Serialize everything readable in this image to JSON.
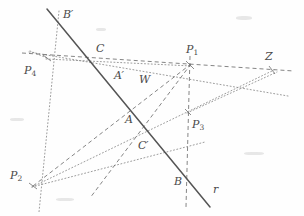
{
  "figure": {
    "type": "geometry-diagram",
    "width": 304,
    "height": 216,
    "background_color": "#fefefe",
    "ink_color": "#4a4a4a",
    "line_color_solid": "#555555",
    "line_color_dashed": "#777777",
    "line_color_dotted": "#8a8a8a"
  },
  "labels": [
    {
      "name": "label-B-prime",
      "base": "B",
      "prime": "′",
      "sub": "",
      "x": 63,
      "y": 9
    },
    {
      "name": "label-C",
      "base": "C",
      "prime": "",
      "sub": "",
      "x": 96,
      "y": 43
    },
    {
      "name": "label-P1",
      "base": "P",
      "prime": "",
      "sub": "1",
      "x": 186,
      "y": 44
    },
    {
      "name": "label-Z",
      "base": "Z",
      "prime": "",
      "sub": "",
      "x": 265,
      "y": 51
    },
    {
      "name": "label-P4",
      "base": "P",
      "prime": "",
      "sub": "4",
      "x": 24,
      "y": 65
    },
    {
      "name": "label-A-prime",
      "base": "A",
      "prime": "′",
      "sub": "",
      "x": 114,
      "y": 70
    },
    {
      "name": "label-W",
      "base": "W",
      "prime": "",
      "sub": "",
      "x": 139,
      "y": 74
    },
    {
      "name": "label-A",
      "base": "A",
      "prime": "",
      "sub": "",
      "x": 125,
      "y": 114
    },
    {
      "name": "label-P3",
      "base": "P",
      "prime": "",
      "sub": "3",
      "x": 192,
      "y": 119
    },
    {
      "name": "label-C-prime",
      "base": "C",
      "prime": "′",
      "sub": "",
      "x": 138,
      "y": 140
    },
    {
      "name": "label-P2",
      "base": "P",
      "prime": "",
      "sub": "2",
      "x": 10,
      "y": 170
    },
    {
      "name": "label-B",
      "base": "B",
      "prime": "",
      "sub": "",
      "x": 174,
      "y": 176
    },
    {
      "name": "label-r",
      "base": "r",
      "prime": "",
      "sub": "",
      "x": 213,
      "y": 184
    }
  ],
  "points": [
    {
      "name": "point-B-prime",
      "label": "B'",
      "x": 58,
      "y": 20
    },
    {
      "name": "point-C",
      "label": "C",
      "x": 104,
      "y": 56
    },
    {
      "name": "point-P1",
      "label": "P1",
      "x": 190,
      "y": 65
    },
    {
      "name": "point-Z",
      "label": "Z",
      "x": 272,
      "y": 70
    },
    {
      "name": "point-P4",
      "label": "P4",
      "x": 47,
      "y": 58
    },
    {
      "name": "point-A-prime",
      "label": "A'",
      "x": 124,
      "y": 82
    },
    {
      "name": "point-W",
      "label": "W",
      "x": 146,
      "y": 88
    },
    {
      "name": "point-A",
      "label": "A",
      "x": 136,
      "y": 126
    },
    {
      "name": "point-P3",
      "label": "P3",
      "x": 188,
      "y": 112
    },
    {
      "name": "point-C-prime",
      "label": "C'",
      "x": 152,
      "y": 150
    },
    {
      "name": "point-P2",
      "label": "P2",
      "x": 33,
      "y": 186
    },
    {
      "name": "point-B",
      "label": "B",
      "x": 185,
      "y": 179
    }
  ],
  "segments": [
    {
      "name": "line-r-solid",
      "style": "solid",
      "x1": 47,
      "y1": 9,
      "x2": 210,
      "y2": 207
    },
    {
      "name": "line-P4-to-Z-dashed",
      "style": "dashed",
      "x1": 23,
      "y1": 53,
      "x2": 292,
      "y2": 71
    },
    {
      "name": "line-P4-diagonal-dotted",
      "style": "dotted",
      "x1": 30,
      "y1": 51,
      "x2": 286,
      "y2": 95
    },
    {
      "name": "line-P4-vertical-dotted",
      "style": "dotted",
      "x1": 58,
      "y1": 12,
      "x2": 40,
      "y2": 210
    },
    {
      "name": "line-P2-to-P1-dashed",
      "style": "dashed",
      "x1": 33,
      "y1": 186,
      "x2": 190,
      "y2": 65
    },
    {
      "name": "line-P2-to-Z-dotted",
      "style": "dotted",
      "x1": 33,
      "y1": 186,
      "x2": 272,
      "y2": 70
    },
    {
      "name": "line-P2-to-P3-dotted",
      "style": "dotted",
      "x1": 33,
      "y1": 186,
      "x2": 200,
      "y2": 143
    },
    {
      "name": "line-P1-to-P2-lower-dashed",
      "style": "dashed",
      "x1": 190,
      "y1": 65,
      "x2": 92,
      "y2": 196
    },
    {
      "name": "line-P1-vertical-dashed",
      "style": "dashed",
      "x1": 190,
      "y1": 57,
      "x2": 186,
      "y2": 205
    },
    {
      "name": "line-P3-to-Z-dotted",
      "style": "dotted",
      "x1": 188,
      "y1": 112,
      "x2": 276,
      "y2": 73
    },
    {
      "name": "line-P1-to-P4-short-dotted",
      "style": "dotted",
      "x1": 47,
      "y1": 58,
      "x2": 190,
      "y2": 65
    }
  ]
}
